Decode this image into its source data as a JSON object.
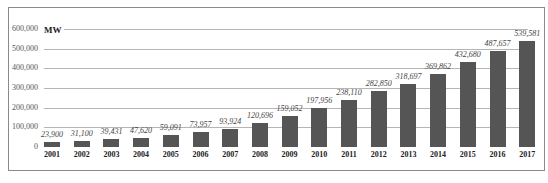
{
  "chart_data": {
    "type": "bar",
    "title": "",
    "unit_label": "MW",
    "xlabel": "",
    "ylabel": "MW",
    "ylim": [
      0,
      600000
    ],
    "grid": true,
    "legend": null,
    "y_ticks": [
      "600,000",
      "500,000",
      "400,000",
      "300,000",
      "200,000",
      "100,000",
      "0"
    ],
    "categories": [
      "2001",
      "2002",
      "2003",
      "2004",
      "2005",
      "2006",
      "2007",
      "2008",
      "2009",
      "2010",
      "2011",
      "2012",
      "2013",
      "2014",
      "2015",
      "2016",
      "2017"
    ],
    "values": [
      23900,
      31100,
      39431,
      47620,
      59091,
      73957,
      93924,
      120696,
      159052,
      197956,
      238110,
      282850,
      318697,
      369862,
      432680,
      487657,
      539581
    ],
    "value_labels": [
      "23,900",
      "31,100",
      "39,431",
      "47,620",
      "59,091",
      "73,957",
      "93,924",
      "120,696",
      "159,052",
      "197,956",
      "238,110",
      "282,850",
      "318,697",
      "369,862",
      "432,680",
      "487,657",
      "539,581"
    ],
    "bar_color": "#555555"
  }
}
